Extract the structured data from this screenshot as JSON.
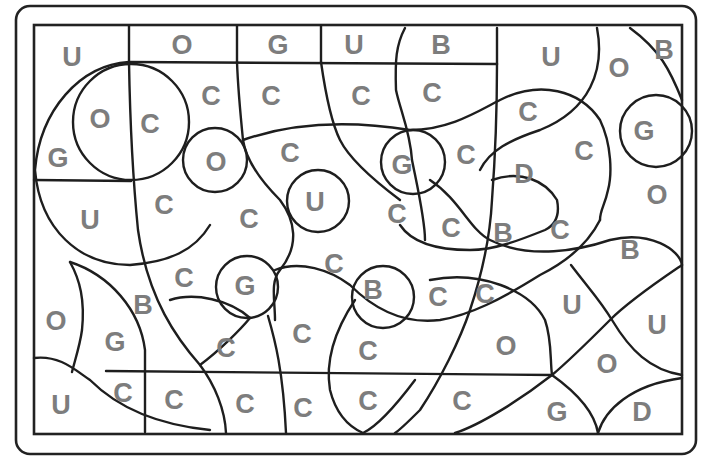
{
  "puzzle": {
    "type": "color-by-letter worksheet",
    "letter_color": "#7d7d7d",
    "line_color": "#1e1e1e",
    "letters": [
      {
        "ch": "U",
        "x": 72,
        "y": 57
      },
      {
        "ch": "O",
        "x": 182,
        "y": 45
      },
      {
        "ch": "G",
        "x": 278,
        "y": 45
      },
      {
        "ch": "U",
        "x": 354,
        "y": 45
      },
      {
        "ch": "B",
        "x": 441,
        "y": 45
      },
      {
        "ch": "U",
        "x": 551,
        "y": 57
      },
      {
        "ch": "O",
        "x": 619,
        "y": 68
      },
      {
        "ch": "B",
        "x": 664,
        "y": 50
      },
      {
        "ch": "C",
        "x": 211,
        "y": 96
      },
      {
        "ch": "C",
        "x": 271,
        "y": 96
      },
      {
        "ch": "C",
        "x": 361,
        "y": 96
      },
      {
        "ch": "C",
        "x": 432,
        "y": 93
      },
      {
        "ch": "C",
        "x": 528,
        "y": 112
      },
      {
        "ch": "G",
        "x": 644,
        "y": 131
      },
      {
        "ch": "O",
        "x": 100,
        "y": 119
      },
      {
        "ch": "C",
        "x": 150,
        "y": 124
      },
      {
        "ch": "G",
        "x": 58,
        "y": 158
      },
      {
        "ch": "O",
        "x": 216,
        "y": 162
      },
      {
        "ch": "C",
        "x": 290,
        "y": 153
      },
      {
        "ch": "G",
        "x": 402,
        "y": 165
      },
      {
        "ch": "C",
        "x": 466,
        "y": 155
      },
      {
        "ch": "D",
        "x": 524,
        "y": 174
      },
      {
        "ch": "C",
        "x": 584,
        "y": 151
      },
      {
        "ch": "O",
        "x": 657,
        "y": 195
      },
      {
        "ch": "U",
        "x": 90,
        "y": 220
      },
      {
        "ch": "C",
        "x": 164,
        "y": 205
      },
      {
        "ch": "C",
        "x": 249,
        "y": 219
      },
      {
        "ch": "U",
        "x": 315,
        "y": 202
      },
      {
        "ch": "C",
        "x": 397,
        "y": 214
      },
      {
        "ch": "C",
        "x": 451,
        "y": 228
      },
      {
        "ch": "B",
        "x": 503,
        "y": 233
      },
      {
        "ch": "C",
        "x": 560,
        "y": 230
      },
      {
        "ch": "B",
        "x": 630,
        "y": 250
      },
      {
        "ch": "C",
        "x": 184,
        "y": 278
      },
      {
        "ch": "G",
        "x": 245,
        "y": 286
      },
      {
        "ch": "C",
        "x": 334,
        "y": 264
      },
      {
        "ch": "B",
        "x": 373,
        "y": 290
      },
      {
        "ch": "C",
        "x": 438,
        "y": 297
      },
      {
        "ch": "C",
        "x": 485,
        "y": 294
      },
      {
        "ch": "U",
        "x": 572,
        "y": 305
      },
      {
        "ch": "U",
        "x": 657,
        "y": 325
      },
      {
        "ch": "O",
        "x": 56,
        "y": 321
      },
      {
        "ch": "B",
        "x": 143,
        "y": 305
      },
      {
        "ch": "G",
        "x": 115,
        "y": 342
      },
      {
        "ch": "C",
        "x": 226,
        "y": 348
      },
      {
        "ch": "C",
        "x": 302,
        "y": 334
      },
      {
        "ch": "C",
        "x": 368,
        "y": 351
      },
      {
        "ch": "O",
        "x": 506,
        "y": 346
      },
      {
        "ch": "O",
        "x": 607,
        "y": 364
      },
      {
        "ch": "U",
        "x": 61,
        "y": 405
      },
      {
        "ch": "C",
        "x": 123,
        "y": 393
      },
      {
        "ch": "C",
        "x": 174,
        "y": 400
      },
      {
        "ch": "C",
        "x": 245,
        "y": 404
      },
      {
        "ch": "C",
        "x": 303,
        "y": 408
      },
      {
        "ch": "C",
        "x": 368,
        "y": 401
      },
      {
        "ch": "C",
        "x": 462,
        "y": 401
      },
      {
        "ch": "G",
        "x": 557,
        "y": 412
      },
      {
        "ch": "D",
        "x": 642,
        "y": 412
      }
    ]
  }
}
